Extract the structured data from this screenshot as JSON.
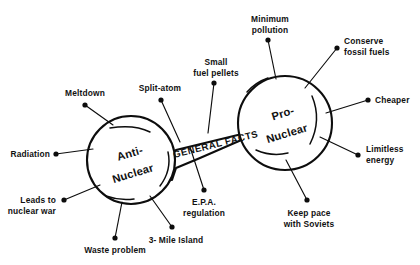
{
  "diagram": {
    "type": "concept-map",
    "background_color": "#ffffff",
    "ink_color": "#0d0d0d",
    "nodes": [
      {
        "id": "anti-nuclear",
        "line1": "Anti-",
        "line2": "Nuclear",
        "cx": 131,
        "cy": 160,
        "r": 44
      },
      {
        "id": "pro-nuclear",
        "line1": "Pro-",
        "line2": "Nuclear",
        "cx": 285,
        "cy": 123,
        "r": 47
      }
    ],
    "connector": {
      "id": "general-facts-band",
      "label": "GENERAL FACTS"
    },
    "spokes": [
      {
        "id": "meltdown",
        "side": "anti",
        "label_lines": [
          "Meltdown"
        ],
        "dot_x": 85,
        "dot_y": 105,
        "text_x": 85,
        "text_y": 96,
        "text_anchor": "middle",
        "line_x2": 113,
        "line_y2": 125
      },
      {
        "id": "radiation",
        "side": "anti",
        "label_lines": [
          "Radiation"
        ],
        "dot_x": 56,
        "dot_y": 154,
        "text_x": 50,
        "text_y": 157,
        "text_anchor": "end",
        "line_x2": 93,
        "line_y2": 149
      },
      {
        "id": "leads-to-nuclear-war",
        "side": "anti",
        "label_lines": [
          "Leads to",
          "nuclear war"
        ],
        "dot_x": 64,
        "dot_y": 200,
        "text_x": 56,
        "text_y": 203,
        "text_anchor": "end",
        "line_x2": 100,
        "line_y2": 185
      },
      {
        "id": "waste-problem",
        "side": "anti",
        "label_lines": [
          "Waste problem"
        ],
        "dot_x": 115,
        "dot_y": 238,
        "text_x": 115,
        "text_y": 253,
        "text_anchor": "middle",
        "line_x2": 122,
        "line_y2": 202
      },
      {
        "id": "three-mile-island",
        "side": "anti",
        "label_lines": [
          "3- Mile Island"
        ],
        "dot_x": 172,
        "dot_y": 227,
        "text_x": 176,
        "text_y": 243,
        "text_anchor": "middle",
        "line_x2": 150,
        "line_y2": 196
      },
      {
        "id": "split-atom",
        "side": "anti",
        "label_lines": [
          "Split-atom"
        ],
        "dot_x": 161,
        "dot_y": 100,
        "text_x": 160,
        "text_y": 91,
        "text_anchor": "middle",
        "line_x2": 180,
        "line_y2": 142
      },
      {
        "id": "small-fuel-pellets",
        "side": "band",
        "label_lines": [
          "Small",
          "fuel pellets"
        ],
        "dot_x": 214,
        "dot_y": 83,
        "text_x": 216,
        "text_y": 65,
        "text_anchor": "middle",
        "line_x2": 208,
        "line_y2": 133
      },
      {
        "id": "epa-regulation",
        "side": "band",
        "label_lines": [
          "E.P.A.",
          "regulation"
        ],
        "dot_x": 204,
        "dot_y": 190,
        "text_x": 204,
        "text_y": 205,
        "text_anchor": "middle",
        "line_x2": 190,
        "line_y2": 147
      },
      {
        "id": "minimum-pollution",
        "side": "pro",
        "label_lines": [
          "Minimum",
          "pollution"
        ],
        "dot_x": 268,
        "dot_y": 40,
        "text_x": 270,
        "text_y": 22,
        "text_anchor": "middle",
        "line_x2": 276,
        "line_y2": 79
      },
      {
        "id": "conserve-fossil-fuels",
        "side": "pro",
        "label_lines": [
          "Conserve",
          "fossil fuels"
        ],
        "dot_x": 337,
        "dot_y": 48,
        "text_x": 344,
        "text_y": 44,
        "text_anchor": "start",
        "line_x2": 305,
        "line_y2": 88
      },
      {
        "id": "cheaper",
        "side": "pro",
        "label_lines": [
          "Cheaper"
        ],
        "dot_x": 368,
        "dot_y": 100,
        "text_x": 375,
        "text_y": 103,
        "text_anchor": "start",
        "line_x2": 326,
        "line_y2": 113
      },
      {
        "id": "limitless-energy",
        "side": "pro",
        "label_lines": [
          "Limitless",
          "energy"
        ],
        "dot_x": 358,
        "dot_y": 155,
        "text_x": 366,
        "text_y": 152,
        "text_anchor": "start",
        "line_x2": 320,
        "line_y2": 137
      },
      {
        "id": "keep-pace-with-soviets",
        "side": "pro",
        "label_lines": [
          "Keep pace",
          "with Soviets"
        ],
        "dot_x": 307,
        "dot_y": 200,
        "text_x": 309,
        "text_y": 216,
        "text_anchor": "middle",
        "line_x2": 286,
        "line_y2": 160
      }
    ]
  }
}
